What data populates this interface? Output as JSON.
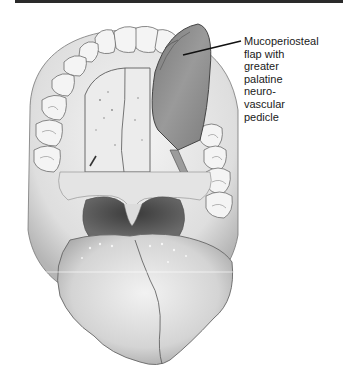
{
  "figure": {
    "callout": {
      "lines": [
        "Mucoperiosteal",
        "flap with",
        "greater",
        "palatine",
        "neuro-",
        "vascular",
        "pedicle"
      ]
    },
    "colors": {
      "rule": "#2a2a2a",
      "leader_line": "#111111",
      "flap_fill": "#8f8f8f",
      "tissue_fill": "#d9d9d9",
      "throat_fill": "#4a4a4a",
      "outline": "#555555"
    }
  }
}
